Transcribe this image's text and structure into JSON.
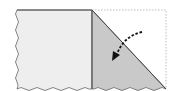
{
  "diagram": {
    "type": "paper-fold-step",
    "colors": {
      "background": "#ffffff",
      "paper_face": "#eeeeee",
      "folded_flap": "#c9c9c9",
      "outline": "#555555",
      "ghost_outline": "#bdbdbd",
      "arrow": "#111111"
    },
    "elements": [
      {
        "name": "paper-left-half",
        "kind": "rectangle-wavy-edges"
      },
      {
        "name": "fold-line",
        "kind": "vertical-line"
      },
      {
        "name": "folded-flap",
        "kind": "triangle"
      },
      {
        "name": "ghost-outline",
        "kind": "dotted-outline",
        "meaning": "original position of the flap"
      },
      {
        "name": "fold-arrow",
        "kind": "dashed-curved-arrow",
        "direction": "down-left"
      }
    ]
  }
}
